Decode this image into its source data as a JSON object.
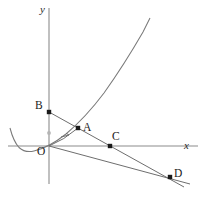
{
  "figure": {
    "width": 206,
    "height": 207,
    "background_color": "#ffffff",
    "axis_color": "#8c8c8c",
    "curve_color": "#7a7a7a",
    "line_color": "#6e6e6e",
    "point_color": "#1a1a1a"
  },
  "axes": {
    "x_label": "x",
    "y_label": "y",
    "origin_label": "O",
    "x_axis": {
      "x1": 8,
      "y1": 146,
      "x2": 198,
      "y2": 146
    },
    "y_axis": {
      "x1": 49,
      "y1": 8,
      "x2": 49,
      "y2": 184
    },
    "x_label_pos": {
      "x": 184,
      "y": 146
    },
    "y_label_pos": {
      "x": 40,
      "y": 11
    },
    "origin_label_pos": {
      "x": 39,
      "y": 152
    }
  },
  "curves": {
    "parabola": {
      "name": "parabola",
      "vertex": {
        "x": 24,
        "y": 150
      },
      "path": "M 10,128 Q 13.5,141.5 19,147.5 Q 25,153 34,151 Q 49,147.5 66,134 Q 86,117 104,93 Q 124,65 143,32 L 150,18"
    }
  },
  "segments": {
    "line_b_to_d": {
      "name": "line-through-B-A-C-D",
      "x1": 49,
      "y1": 112,
      "x2": 184,
      "y2": 187
    },
    "line_o_to_d": {
      "name": "line-from-origin-through-D",
      "x1": 49,
      "y1": 146,
      "x2": 190,
      "y2": 184
    },
    "tangent_o_to_a": {
      "name": "tangent-segment-O-to-A",
      "path": "M 49,146 Q 64,140 78,128"
    },
    "tick": {
      "name": "tick-mark",
      "x1": 61,
      "y1": 137,
      "x2": 69,
      "y2": 135
    }
  },
  "points": [
    {
      "id": "B",
      "label": "B",
      "x": 49,
      "y": 112,
      "label_x": 37,
      "label_y": 105,
      "on": "y-axis",
      "style": "solid"
    },
    {
      "id": "A",
      "label": "A",
      "x": 78,
      "y": 128,
      "label_x": 83,
      "label_y": 127,
      "on": "parabola",
      "style": "solid"
    },
    {
      "id": "C",
      "label": "C",
      "x": 110,
      "y": 146,
      "label_x": 113,
      "label_y": 136,
      "on": "x-axis",
      "style": "solid"
    },
    {
      "id": "D",
      "label": "D",
      "x": 170,
      "y": 177,
      "label_x": 175,
      "label_y": 172,
      "on": "intersection",
      "style": "solid"
    },
    {
      "id": "P",
      "label": "",
      "x": 49,
      "y": 133,
      "label_x": 0,
      "label_y": 0,
      "on": "y-axis",
      "style": "faint"
    }
  ]
}
